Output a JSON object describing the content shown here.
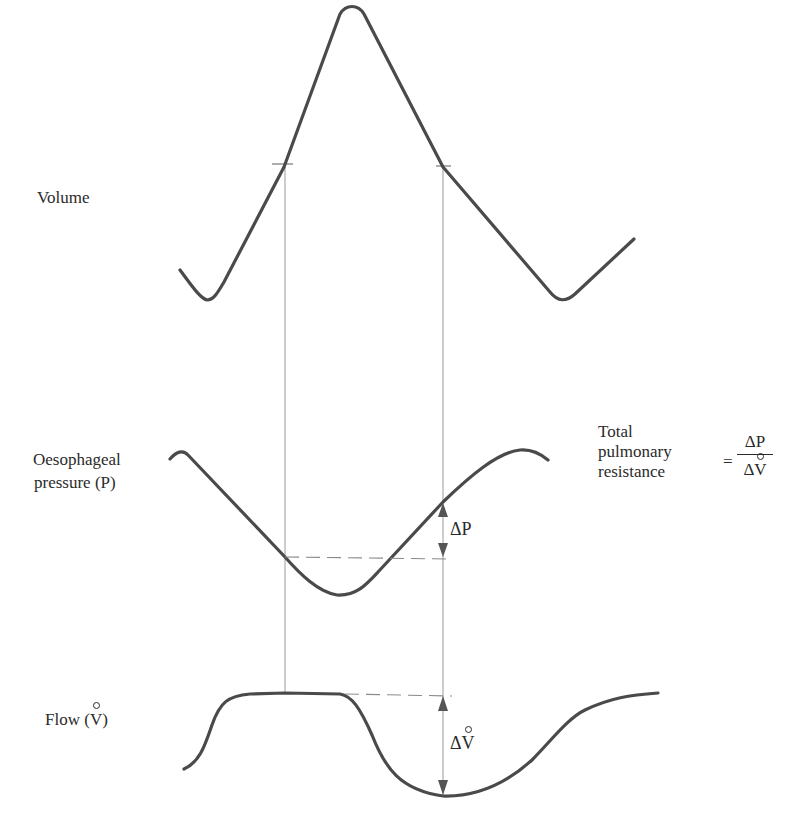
{
  "figure": {
    "labels": {
      "volume": "Volume",
      "pressure_line1": "Oesophageal",
      "pressure_line2": "pressure (P)",
      "flow_prefix": "Flow (",
      "flow_symbol": "V",
      "flow_suffix": ")",
      "delta_p": "ΔP",
      "delta_v_prefix": "Δ",
      "delta_v_symbol": "V"
    },
    "formula": {
      "text_line1": "Total",
      "text_line2": "pulmonary",
      "text_line3": "resistance",
      "equals": "=",
      "numerator": "ΔP",
      "denominator_prefix": "Δ",
      "denominator_symbol": "V"
    },
    "colors": {
      "trace": "#4a4a4a",
      "guide": "#9a9a9a",
      "text": "#2b2b2b"
    },
    "traces": [
      {
        "name": "Volume",
        "shape": "triangular wave: trough ~x205, peak ~x352, trough ~x562"
      },
      {
        "name": "Oesophageal pressure (P)",
        "shape": "inverted wave: high ~x180, low ~x340, high ~x520"
      },
      {
        "name": "Flow (V̊)",
        "shape": "plateau ~x235-345, trough ~x443, rises to ~x655"
      }
    ],
    "annotations": {
      "vertical_guides_x": [
        285,
        443
      ],
      "volume_tick_marks_y": 165,
      "pressure_dashed_level_y": 557,
      "flow_dashed_level_y": 694,
      "delta_p_range_y": [
        502,
        557
      ],
      "delta_v_range_y": [
        694,
        796
      ]
    }
  }
}
